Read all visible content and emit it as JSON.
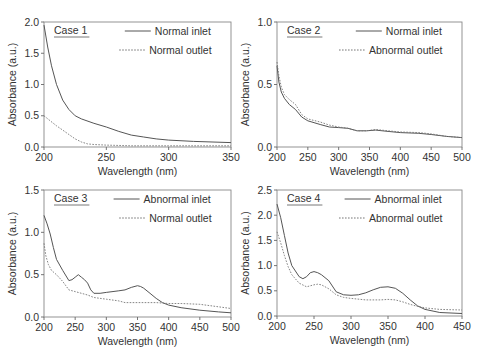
{
  "chart_data": [
    {
      "type": "line",
      "panel_label": "Case 1",
      "xlabel": "Wavelength (nm)",
      "ylabel": "Absorbance (a.u.)",
      "xlim": [
        200,
        350
      ],
      "ylim": [
        0,
        2.0
      ],
      "xticks": [
        200,
        250,
        300,
        350
      ],
      "yticks": [
        0.0,
        0.5,
        1.0,
        1.5,
        2.0
      ],
      "ytick_labels": [
        "0.0",
        "0.5",
        "1.0",
        "1.5",
        "2.0"
      ],
      "grid": false,
      "legend_position": "upper right",
      "series": [
        {
          "name": "Normal inlet",
          "style": "solid",
          "x": [
            200,
            203,
            206,
            210,
            215,
            220,
            225,
            230,
            240,
            250,
            260,
            270,
            280,
            290,
            300,
            320,
            350
          ],
          "y": [
            1.95,
            1.6,
            1.3,
            1.0,
            0.75,
            0.6,
            0.5,
            0.45,
            0.38,
            0.32,
            0.25,
            0.19,
            0.16,
            0.13,
            0.11,
            0.09,
            0.07
          ]
        },
        {
          "name": "Normal outlet",
          "style": "dotted",
          "x": [
            200,
            205,
            210,
            215,
            220,
            225,
            230,
            235,
            240,
            250,
            270,
            300,
            350
          ],
          "y": [
            0.5,
            0.42,
            0.34,
            0.27,
            0.2,
            0.13,
            0.08,
            0.05,
            0.04,
            0.03,
            0.02,
            0.02,
            0.02
          ]
        }
      ]
    },
    {
      "type": "line",
      "panel_label": "Case 2",
      "xlabel": "Wavelength (nm)",
      "ylabel": "Absorbance (a.u.)",
      "xlim": [
        200,
        500
      ],
      "ylim": [
        0,
        1.0
      ],
      "xticks": [
        200,
        250,
        300,
        350,
        400,
        450,
        500
      ],
      "yticks": [
        0.0,
        0.5,
        1.0
      ],
      "ytick_labels": [
        "0.0",
        "0.5",
        "1.0"
      ],
      "grid": false,
      "legend_position": "upper right",
      "series": [
        {
          "name": "Normal inlet",
          "style": "solid",
          "x": [
            200,
            203,
            207,
            212,
            220,
            230,
            240,
            250,
            270,
            285,
            300,
            315,
            330,
            345,
            360,
            380,
            400,
            430,
            450,
            475,
            500
          ],
          "y": [
            0.65,
            0.52,
            0.44,
            0.39,
            0.34,
            0.3,
            0.24,
            0.21,
            0.18,
            0.16,
            0.155,
            0.15,
            0.13,
            0.13,
            0.135,
            0.125,
            0.115,
            0.11,
            0.1,
            0.085,
            0.075
          ]
        },
        {
          "name": "Abnormal outlet",
          "style": "dotted",
          "x": [
            200,
            203,
            207,
            212,
            220,
            230,
            240,
            250,
            270,
            285,
            300,
            315,
            330,
            345,
            360,
            380,
            400,
            430,
            450,
            475,
            500
          ],
          "y": [
            0.68,
            0.57,
            0.48,
            0.42,
            0.38,
            0.34,
            0.26,
            0.225,
            0.2,
            0.175,
            0.16,
            0.15,
            0.13,
            0.13,
            0.14,
            0.13,
            0.12,
            0.115,
            0.105,
            0.085,
            0.075
          ]
        }
      ]
    },
    {
      "type": "line",
      "panel_label": "Case 3",
      "xlabel": "Wavelength (nm)",
      "ylabel": "Absorbance (a.u.)",
      "xlim": [
        200,
        500
      ],
      "ylim": [
        0,
        1.5
      ],
      "xticks": [
        200,
        250,
        300,
        350,
        400,
        450,
        500
      ],
      "yticks": [
        0.0,
        0.5,
        1.0,
        1.5
      ],
      "ytick_labels": [
        "0.0",
        "0.5",
        "1.0",
        "1.5"
      ],
      "grid": false,
      "legend_position": "upper right",
      "series": [
        {
          "name": "Abnormal inlet",
          "style": "solid",
          "x": [
            200,
            205,
            210,
            215,
            220,
            230,
            240,
            245,
            250,
            255,
            260,
            265,
            270,
            275,
            280,
            290,
            300,
            320,
            330,
            340,
            350,
            355,
            360,
            370,
            380,
            390,
            400,
            420,
            450,
            480,
            500
          ],
          "y": [
            1.2,
            1.1,
            0.98,
            0.82,
            0.68,
            0.55,
            0.43,
            0.44,
            0.47,
            0.5,
            0.47,
            0.44,
            0.4,
            0.32,
            0.28,
            0.28,
            0.29,
            0.31,
            0.32,
            0.35,
            0.37,
            0.36,
            0.34,
            0.28,
            0.22,
            0.17,
            0.14,
            0.11,
            0.08,
            0.06,
            0.05
          ]
        },
        {
          "name": "Normal outlet",
          "style": "dotted",
          "x": [
            200,
            203,
            207,
            212,
            220,
            230,
            240,
            250,
            260,
            270,
            280,
            300,
            320,
            330,
            350,
            380,
            400,
            420,
            450,
            480,
            500
          ],
          "y": [
            0.87,
            0.72,
            0.62,
            0.55,
            0.5,
            0.42,
            0.32,
            0.3,
            0.28,
            0.26,
            0.23,
            0.21,
            0.19,
            0.17,
            0.17,
            0.17,
            0.16,
            0.16,
            0.15,
            0.12,
            0.1
          ]
        }
      ]
    },
    {
      "type": "line",
      "panel_label": "Case 4",
      "xlabel": "Wavelength (nm)",
      "ylabel": "Absorbance (a.u.)",
      "xlim": [
        200,
        450
      ],
      "ylim": [
        0,
        2.5
      ],
      "xticks": [
        200,
        250,
        300,
        350,
        400,
        450
      ],
      "yticks": [
        0.0,
        0.5,
        1.0,
        1.5,
        2.0,
        2.5
      ],
      "ytick_labels": [
        "0.0",
        "0.5",
        "1.0",
        "1.5",
        "2.0",
        "2.5"
      ],
      "grid": false,
      "legend_position": "upper right",
      "series": [
        {
          "name": "Abnormal inlet",
          "style": "solid",
          "x": [
            200,
            205,
            210,
            215,
            220,
            230,
            235,
            240,
            245,
            250,
            255,
            260,
            270,
            280,
            290,
            300,
            310,
            320,
            330,
            340,
            350,
            360,
            370,
            380,
            390,
            400,
            420,
            450
          ],
          "y": [
            2.22,
            1.95,
            1.6,
            1.25,
            1.0,
            0.78,
            0.74,
            0.78,
            0.86,
            0.88,
            0.86,
            0.82,
            0.7,
            0.48,
            0.42,
            0.41,
            0.42,
            0.46,
            0.52,
            0.57,
            0.58,
            0.55,
            0.45,
            0.32,
            0.2,
            0.13,
            0.07,
            0.05
          ]
        },
        {
          "name": "Abnormal outlet",
          "style": "dotted",
          "x": [
            200,
            205,
            210,
            215,
            220,
            230,
            240,
            245,
            250,
            255,
            260,
            270,
            280,
            290,
            300,
            320,
            340,
            350,
            360,
            370,
            380,
            390,
            400,
            420,
            450
          ],
          "y": [
            1.67,
            1.45,
            1.2,
            0.98,
            0.82,
            0.65,
            0.58,
            0.6,
            0.62,
            0.63,
            0.62,
            0.54,
            0.42,
            0.37,
            0.35,
            0.32,
            0.32,
            0.33,
            0.32,
            0.28,
            0.23,
            0.19,
            0.16,
            0.13,
            0.12
          ]
        }
      ]
    }
  ],
  "panels_layout": [
    {
      "plot": {
        "x": 44,
        "y": 22,
        "w": 187,
        "h": 125
      }
    },
    {
      "plot": {
        "x": 277,
        "y": 22,
        "w": 185,
        "h": 125
      }
    },
    {
      "plot": {
        "x": 44,
        "y": 190,
        "w": 187,
        "h": 127
      }
    },
    {
      "plot": {
        "x": 277,
        "y": 190,
        "w": 185,
        "h": 126
      }
    }
  ]
}
